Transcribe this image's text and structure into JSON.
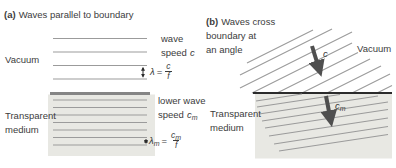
{
  "colors": {
    "text": "#3c3c3c",
    "line": "#9b9b9b",
    "boundaryA": "#858585",
    "boundaryB": "#2b2b2b",
    "shade": "#e8e8e3",
    "arrow": "#4f4f4f",
    "dimArrow": "#2b2b2b"
  },
  "panel_a": {
    "title_tag": "(a)",
    "title": "Waves parallel to boundary",
    "vacuum_label": "Vacuum",
    "medium_label_line1": "Transparent",
    "medium_label_line2": "medium",
    "wave_speed_line1": "wave",
    "wave_speed_line2": "speed",
    "wave_speed_symbol": "c",
    "wavelength_formula": {
      "lhs": "λ",
      "eq": "=",
      "num": "c",
      "den": "f"
    },
    "lower_speed_line1": "lower wave",
    "lower_speed_line2": "speed",
    "lower_speed_symbol": "c",
    "lower_speed_symbol_sub": "m",
    "wavelength_m_formula": {
      "lhs": "λ",
      "lhs_sub": "m",
      "eq": "=",
      "num": "c",
      "num_sub": "m",
      "den": "f"
    }
  },
  "panel_b": {
    "title_tag": "(b)",
    "title_line1": "Waves cross",
    "title_line2": "boundary at",
    "title_line3": "an angle",
    "vacuum_label": "Vacuum",
    "medium_label_line1": "Transparent",
    "medium_label_line2": "medium",
    "incident_speed_symbol": "c",
    "refracted_speed_symbol": "c",
    "refracted_speed_symbol_sub": "m"
  }
}
